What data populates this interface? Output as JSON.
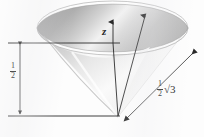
{
  "figure": {
    "type": "3d-cone-diagram",
    "background_color": "#fdfdfd",
    "line_color": "#2a2a2a",
    "axis": {
      "label": "z",
      "description": "vertical z-axis with upward arrowhead through cone center"
    },
    "labels": {
      "height": {
        "numerator": "1",
        "denominator": "2",
        "meaning": "cone height = one half"
      },
      "slant": {
        "numerator": "1",
        "denominator": "2",
        "radical": "√3",
        "meaning": "slant dimension = one half times square root of three"
      }
    },
    "dimension_lines": [
      {
        "name": "height-dimension",
        "orientation": "vertical",
        "arrowheads": "both",
        "label": "1/2"
      },
      {
        "name": "slant-dimension",
        "orientation": "diagonal",
        "arrowheads": "both",
        "label": "1/2 √3"
      }
    ],
    "shape": {
      "name": "inverted-cone",
      "top": "ellipse-rim",
      "apex": "bottom-center",
      "shading": "gray gradient, dark left, light highlight right"
    }
  }
}
